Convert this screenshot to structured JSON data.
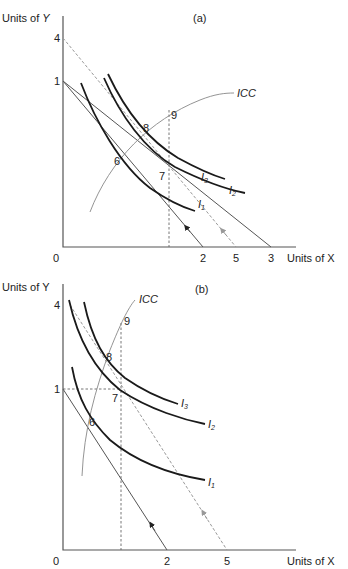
{
  "panels": [
    {
      "id": "a",
      "tag": "(a)",
      "y_axis_label": "Units of Y",
      "x_axis_label": "Units of X",
      "origin_label": "0",
      "y_ticks": [
        "4",
        "1"
      ],
      "x_ticks": [
        "2",
        "5",
        "3"
      ],
      "icc_label": "ICC",
      "points": [
        "6",
        "7",
        "8",
        "9"
      ],
      "curves": [
        {
          "name": "I",
          "sub": "1"
        },
        {
          "name": "I",
          "sub": "2"
        },
        {
          "name": "I",
          "sub": "3"
        }
      ]
    },
    {
      "id": "b",
      "tag": "(b)",
      "y_axis_label": "Units of Y",
      "x_axis_label": "Units of X",
      "origin_label": "0",
      "y_ticks": [
        "4",
        "1"
      ],
      "x_ticks": [
        "2",
        "5"
      ],
      "icc_label": "ICC",
      "points": [
        "6",
        "7",
        "8",
        "9"
      ],
      "curves": [
        {
          "name": "I",
          "sub": "1"
        },
        {
          "name": "I",
          "sub": "2"
        },
        {
          "name": "I",
          "sub": "3"
        }
      ]
    }
  ]
}
